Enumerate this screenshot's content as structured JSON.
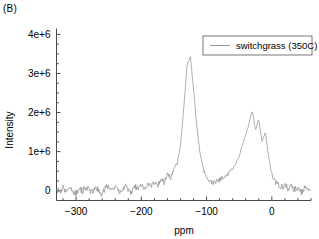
{
  "panel": {
    "label": "(B)"
  },
  "chart_data": {
    "type": "line",
    "title": "",
    "subtitle": "",
    "xlabel": "ppm",
    "ylabel": "Intensity",
    "xlim": [
      -330,
      60
    ],
    "ylim": [
      -250000,
      4150000
    ],
    "xticks": [
      -300,
      -200,
      -100,
      0
    ],
    "xticklabels": [
      "−300",
      "−200",
      "−100",
      "0"
    ],
    "xminor_step": 20,
    "yticks": [
      0,
      1000000,
      2000000,
      3000000,
      4000000
    ],
    "yticklabels": [
      "0",
      "1e+6",
      "2e+6",
      "3e+6",
      "4e+6"
    ],
    "yminor_step": 250000,
    "grid": false,
    "legend_position": "upper-right",
    "series": [
      {
        "name": "switchgrass (350C)",
        "color": "#8c8c8c",
        "peaks": [
          {
            "center": -128,
            "height": 3450000,
            "width": 14,
            "label": "main-aromatic-peak"
          },
          {
            "center": -25,
            "height": 1560000,
            "width": 11,
            "label": "secondary-peak-a"
          },
          {
            "center": -17,
            "height": 1180000,
            "width": 6,
            "label": "secondary-peak-b"
          },
          {
            "center": -8,
            "height": 1020000,
            "width": 6,
            "label": "secondary-peak-c"
          },
          {
            "center": -45,
            "height": 380000,
            "width": 26,
            "label": "shoulder-left"
          },
          {
            "center": -160,
            "height": 260000,
            "width": 30,
            "label": "shoulder-far-left"
          }
        ],
        "baseline": 0,
        "noise_amplitude": 85000,
        "x": [
          -330,
          -325,
          -320,
          -315,
          -310,
          -305,
          -300,
          -295,
          -290,
          -285,
          -280,
          -275,
          -270,
          -265,
          -260,
          -255,
          -250,
          -245,
          -240,
          -235,
          -230,
          -225,
          -220,
          -215,
          -210,
          -205,
          -200,
          -195,
          -190,
          -185,
          -180,
          -175,
          -170,
          -165,
          -160,
          -155,
          -150,
          -145,
          -140,
          -135,
          -130,
          -125,
          -120,
          -115,
          -110,
          -105,
          -100,
          -95,
          -90,
          -85,
          -80,
          -75,
          -70,
          -65,
          -60,
          -55,
          -50,
          -45,
          -40,
          -35,
          -30,
          -25,
          -20,
          -15,
          -10,
          -5,
          0,
          5,
          10,
          15,
          20,
          25,
          30,
          35,
          40,
          45,
          50,
          55,
          60
        ],
        "y": [
          60000,
          -40000,
          90000,
          -60000,
          120000,
          10000,
          -70000,
          80000,
          -30000,
          100000,
          40000,
          -50000,
          110000,
          0,
          -80000,
          70000,
          130000,
          -20000,
          90000,
          30000,
          -60000,
          140000,
          50000,
          -40000,
          120000,
          60000,
          150000,
          40000,
          180000,
          90000,
          220000,
          140000,
          300000,
          210000,
          420000,
          330000,
          560000,
          700000,
          1150000,
          2100000,
          3200000,
          3450000,
          2600000,
          1650000,
          950000,
          560000,
          330000,
          240000,
          190000,
          230000,
          280000,
          330000,
          390000,
          470000,
          560000,
          700000,
          900000,
          1180000,
          1420000,
          1720000,
          2050000,
          1560000,
          1830000,
          1250000,
          1500000,
          880000,
          420000,
          240000,
          150000,
          90000,
          140000,
          60000,
          110000,
          20000,
          80000,
          -30000,
          70000,
          10000,
          -50000
        ]
      }
    ]
  },
  "legend": {
    "entries": [
      {
        "label": "switchgrass (350C)",
        "color": "#8c8c8c"
      }
    ]
  }
}
